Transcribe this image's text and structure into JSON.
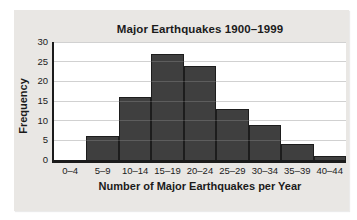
{
  "chart_data": {
    "type": "bar",
    "title": "Major Earthquakes 1900–1999",
    "xlabel": "Number of Major Earthquakes per Year",
    "ylabel": "Frequency",
    "categories": [
      "0–4",
      "5–9",
      "10–14",
      "15–19",
      "20–24",
      "25–29",
      "30–34",
      "35–39",
      "40–44"
    ],
    "values": [
      0,
      6,
      16,
      27,
      24,
      13,
      9,
      4,
      1
    ],
    "ylim": [
      0,
      30
    ],
    "yticks": [
      0,
      5,
      10,
      15,
      20,
      25,
      30
    ],
    "grid": true,
    "legend": "none",
    "colors": {
      "bar_fill": "#3f3f3f",
      "bar_border": "#1d1d1d",
      "panel_background": "#e9e7e4",
      "plot_background": "#ffffff",
      "gridline": "#c9c9c9",
      "gridline_over_bars": "rgba(255,255,255,0.16)",
      "axis": "#1b1b1b",
      "text": "#1b1b1b"
    }
  }
}
